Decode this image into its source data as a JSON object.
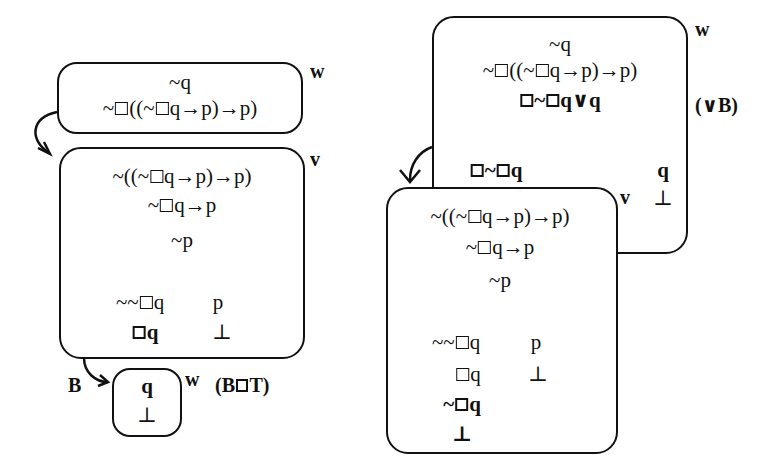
{
  "left_diagram": {
    "world_w_top": {
      "label": "w",
      "lines": [
        "~q",
        "~□((~□q→p)→p)"
      ]
    },
    "world_v": {
      "label": "v",
      "lines": [
        "~((~□q→p)→p)",
        "~□q→p",
        "~p"
      ],
      "branches": {
        "left": [
          "~~□q",
          "□q"
        ],
        "right": [
          "p",
          "⊥"
        ]
      }
    },
    "world_w_bottom": {
      "label": "w",
      "arrow_label": "B",
      "lines": [
        "q",
        "⊥"
      ],
      "rule": "(B□T)"
    }
  },
  "right_diagram": {
    "world_w": {
      "label": "w",
      "lines": [
        "~q",
        "~□((~□q→p)→p)",
        "□~□q∨q"
      ],
      "rule": "(∨B)",
      "branches": {
        "left": [
          "□~□q"
        ],
        "right": [
          "q",
          "⊥"
        ]
      }
    },
    "world_v": {
      "label": "v",
      "lines": [
        "~((~□q→p)→p)",
        "~□q→p",
        "~p"
      ],
      "branches": {
        "left": [
          "~~□q",
          "□q",
          "~□q",
          "⊥"
        ],
        "right": [
          "p",
          "⊥"
        ]
      }
    }
  }
}
